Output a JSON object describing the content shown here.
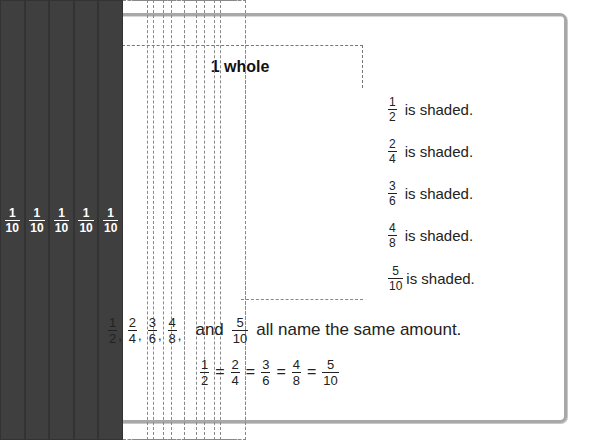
{
  "diagram": {
    "whole_label": "1 whole",
    "colors": {
      "halves": "#8c8c8c",
      "fourths": "#b8b8b8",
      "sixths": "#6b6b6b",
      "eighths": "#4c4c4c",
      "tenths": "#3f3f3f"
    },
    "rows": [
      {
        "name": "halves",
        "denominator": "2",
        "numerator": "1",
        "shaded_count": 1,
        "total": 2
      },
      {
        "name": "fourths",
        "denominator": "4",
        "numerator": "1",
        "shaded_count": 2,
        "total": 4
      },
      {
        "name": "sixths",
        "denominator": "6",
        "numerator": "1",
        "shaded_count": 3,
        "total": 6
      },
      {
        "name": "eighths",
        "denominator": "8",
        "numerator": "1",
        "shaded_count": 4,
        "total": 8
      },
      {
        "name": "tenths",
        "denominator": "10",
        "numerator": "1",
        "shaded_count": 5,
        "total": 10
      }
    ],
    "labels": [
      {
        "num": "1",
        "den": "2",
        "text": "is shaded."
      },
      {
        "num": "2",
        "den": "4",
        "text": "is shaded."
      },
      {
        "num": "3",
        "den": "6",
        "text": "is shaded."
      },
      {
        "num": "4",
        "den": "8",
        "text": "is shaded."
      },
      {
        "num": "5",
        "den": "10",
        "text": "is shaded."
      }
    ]
  },
  "sentence": {
    "fractions": [
      {
        "num": "1",
        "den": "2"
      },
      {
        "num": "2",
        "den": "4"
      },
      {
        "num": "3",
        "den": "6"
      },
      {
        "num": "4",
        "den": "8"
      },
      {
        "num": "5",
        "den": "10"
      }
    ],
    "comma": ",",
    "and_word": "and",
    "tail": "all name the same amount."
  },
  "equation": {
    "fractions": [
      {
        "num": "1",
        "den": "2"
      },
      {
        "num": "2",
        "den": "4"
      },
      {
        "num": "3",
        "den": "6"
      },
      {
        "num": "4",
        "den": "8"
      },
      {
        "num": "5",
        "den": "10"
      }
    ],
    "equals": "="
  }
}
